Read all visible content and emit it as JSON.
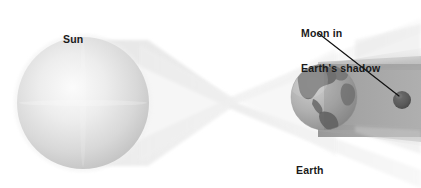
{
  "diagram": {
    "background_color": "#ffffff",
    "width": 421,
    "height": 188,
    "labels": {
      "sun": "Sun",
      "earth": "Earth",
      "moon_line1": "Moon in",
      "moon_line2": "Earth's shadow"
    },
    "bodies": [
      {
        "name": "sun",
        "label": "Sun",
        "shape": "sphere",
        "cx": 83,
        "cy": 103,
        "r": 66,
        "fill_light": "#f2f2f2",
        "fill_mid": "#cfcfcf",
        "fill_dark": "#b9b9b9"
      },
      {
        "name": "earth",
        "label": "Earth",
        "shape": "sphere",
        "cx": 324,
        "cy": 97,
        "r": 33,
        "fill_ocean": "#b6b6b6",
        "fill_land": "#6e6e6e",
        "fill_shadowside": "#8a8a8a"
      },
      {
        "name": "moon",
        "label": "Moon in Earth's shadow",
        "shape": "sphere",
        "cx": 402,
        "cy": 100,
        "r": 9,
        "fill": "#5d5d5d",
        "fill_dark": "#4a4a4a"
      }
    ],
    "light_cones": {
      "name": "sunlight-rays",
      "color": "#ededed",
      "crossover_x": 238,
      "crossover_y": 103,
      "upper_ray_color": "#efefef",
      "lower_ray_color": "#f4f4f4"
    },
    "shadow": {
      "name": "earth-umbra",
      "color": "#9a9a9a",
      "penumbra_color": "#c6c6c6",
      "start_x": 324,
      "end_x": 421,
      "top_y": 64,
      "bottom_y": 137
    },
    "leader_line": {
      "name": "moon-leader-line",
      "color": "#111111",
      "x1": 318,
      "y1": 33,
      "x2": 399,
      "y2": 96,
      "width": 1.2
    }
  }
}
